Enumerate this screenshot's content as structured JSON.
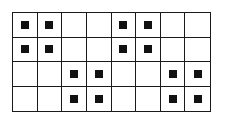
{
  "grid": {
    "rows": 4,
    "cols": 8,
    "line_color": "#1a1a1a",
    "fill_color": "#111111",
    "cells": [
      [
        1,
        1,
        0,
        0,
        1,
        1,
        0,
        0
      ],
      [
        1,
        1,
        0,
        0,
        1,
        1,
        0,
        0
      ],
      [
        0,
        0,
        1,
        1,
        0,
        0,
        1,
        1
      ],
      [
        0,
        0,
        1,
        1,
        0,
        0,
        1,
        1
      ]
    ]
  }
}
